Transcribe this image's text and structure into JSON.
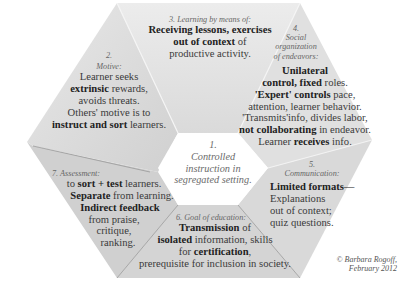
{
  "center": {
    "number": "1.",
    "line1": "Controlled",
    "line2": "instruction in",
    "line3": "segregated setting."
  },
  "sections": {
    "motive": {
      "number": "2.",
      "heading": "Motive:",
      "l1": "Learner seeks",
      "l2_bold": "extrinsic",
      "l2_rest": " rewards,",
      "l3": "avoids threats.",
      "l4": "Others' motive is to",
      "l5_bold": "instruct and sort",
      "l5_rest": " learners."
    },
    "learning": {
      "heading": "3.  Learning by means of:",
      "l1_bold": "Receiving lessons, exercises",
      "l2_bold": "out of context",
      "l2_rest": " of",
      "l3": "productive activity."
    },
    "social": {
      "number": "4.",
      "heading1": "Social",
      "heading2": "organization",
      "heading3": "of endeavors:",
      "l1_bold": "Unilateral",
      "l2_bold": "control, fixed",
      "l2_rest": " roles.",
      "l3_bold": "'Expert' controls",
      "l3_rest": " pace,",
      "l4": "attention, learner behavior.",
      "l5": "'Transmits'info, divides labor,",
      "l6_bold": "not collaborating",
      "l6_rest": " in endeavor.",
      "l7_pre": "Learner ",
      "l7_bold": "receives",
      "l7_rest": " info."
    },
    "communication": {
      "number": "5.",
      "heading": "Communication:",
      "l1_bold": "Limited formats—",
      "l2": "Explanations",
      "l3": "out of context;",
      "l4": "quiz questions."
    },
    "goal": {
      "heading": "6. Goal of education:",
      "l1_bold": "Transmission",
      "l1_rest": " of",
      "l2_bold": "isolated",
      "l2_rest": " information, skills",
      "l3_pre": "for ",
      "l3_bold": "certification",
      "l3_rest": ",",
      "l4": "prerequisite for inclusion in society."
    },
    "assessment": {
      "heading": "7. Assessment:",
      "l1_pre": "to ",
      "l1_bold": "sort + test",
      "l1_rest": " learners.",
      "l2_bold": "Separate",
      "l2_rest": " from learning.",
      "l3_bold": "Indirect feedback",
      "l4": "from praise,",
      "l5": "critique,",
      "l6": "ranking."
    }
  },
  "copyright": {
    "line1": "© Barbara Rogoff,",
    "line2": "February 2012"
  },
  "colors": {
    "section_fill": "#d6d6d6",
    "section_fill_light": "#e2e2e2",
    "center_fill": "#ffffff",
    "divider": "#8a8a8a"
  }
}
